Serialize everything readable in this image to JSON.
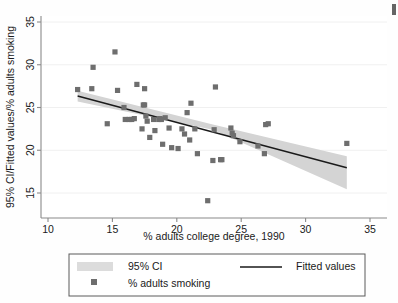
{
  "chart_data": {
    "type": "scatter",
    "title": "",
    "xlabel": "% adults college degree, 1990",
    "ylabel": "95% CI/Fitted values/% adults smoking",
    "xlim": [
      10,
      35
    ],
    "ylim": [
      13,
      35.8
    ],
    "xticks": [
      10,
      15,
      20,
      25,
      30,
      35
    ],
    "yticks": [
      15,
      20,
      25,
      30,
      35
    ],
    "xtick_labels": [
      "10",
      "15",
      "20",
      "25",
      "30",
      "35"
    ],
    "ytick_labels": [
      "15",
      "20",
      "25",
      "30",
      "35"
    ],
    "grid": "horizontal",
    "legend_position": "below-plot",
    "series": [
      {
        "name": "% adults smoking",
        "type": "scatter",
        "marker": "square",
        "color": "#6e6e6e",
        "points": [
          [
            12.3,
            27.1
          ],
          [
            13.4,
            27.2
          ],
          [
            13.5,
            29.7
          ],
          [
            14.6,
            23.1
          ],
          [
            15.2,
            31.5
          ],
          [
            15.4,
            27.0
          ],
          [
            15.9,
            25.0
          ],
          [
            16.0,
            23.6
          ],
          [
            16.3,
            23.6
          ],
          [
            16.5,
            23.6
          ],
          [
            16.7,
            23.7
          ],
          [
            16.9,
            27.7
          ],
          [
            17.3,
            22.5
          ],
          [
            17.4,
            25.3
          ],
          [
            17.5,
            25.3
          ],
          [
            17.5,
            27.2
          ],
          [
            17.6,
            24.0
          ],
          [
            17.7,
            23.4
          ],
          [
            17.9,
            21.5
          ],
          [
            18.2,
            23.6
          ],
          [
            18.3,
            22.3
          ],
          [
            18.6,
            23.6
          ],
          [
            18.7,
            23.7
          ],
          [
            18.8,
            23.6
          ],
          [
            18.9,
            20.7
          ],
          [
            19.1,
            23.8
          ],
          [
            19.4,
            22.6
          ],
          [
            19.6,
            20.3
          ],
          [
            20.1,
            20.2
          ],
          [
            20.4,
            22.5
          ],
          [
            20.6,
            21.9
          ],
          [
            20.8,
            24.4
          ],
          [
            21.0,
            21.2
          ],
          [
            21.1,
            25.5
          ],
          [
            21.4,
            22.5
          ],
          [
            21.6,
            19.6
          ],
          [
            22.4,
            14.1
          ],
          [
            22.8,
            18.8
          ],
          [
            22.9,
            22.4
          ],
          [
            23.0,
            27.4
          ],
          [
            23.4,
            18.9
          ],
          [
            23.5,
            18.9
          ],
          [
            24.2,
            22.6
          ],
          [
            24.3,
            22.0
          ],
          [
            24.4,
            21.7
          ],
          [
            24.9,
            21.0
          ],
          [
            26.3,
            20.5
          ],
          [
            26.8,
            19.6
          ],
          [
            26.9,
            23.0
          ],
          [
            27.1,
            23.1
          ],
          [
            33.2,
            20.8
          ]
        ]
      },
      {
        "name": "Fitted values",
        "type": "line",
        "color": "#1a1a1a",
        "x": [
          12.3,
          33.2
        ],
        "y": [
          26.35,
          17.95
        ]
      },
      {
        "name": "95% CI",
        "type": "band",
        "color": "#d4d4d4",
        "x": [
          12.3,
          22.8,
          33.2
        ],
        "upper": [
          26.95,
          23.0,
          19.3
        ],
        "lower": [
          25.7,
          22.4,
          15.45
        ]
      }
    ]
  },
  "legend": {
    "items": [
      {
        "label": "95% CI",
        "icon": "gray-band-swatch"
      },
      {
        "label": "Fitted values",
        "icon": "line-swatch"
      },
      {
        "label": "% adults smoking",
        "icon": "square-marker-swatch"
      }
    ]
  },
  "colors": {
    "marker": "#6e6e6e",
    "fit_line": "#1a1a1a",
    "ci_band": "#d4d4d4",
    "axis": "#808080",
    "grid": "#f0f0f0",
    "background": "#ffffff"
  }
}
